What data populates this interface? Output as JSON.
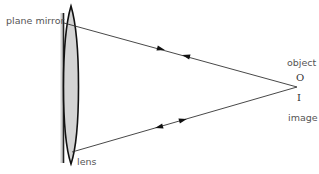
{
  "labels": {
    "mirror": "plane mirror",
    "lens": "lens",
    "object": "object",
    "object_symbol": "O",
    "image_symbol": "I",
    "image": "image"
  },
  "colors": {
    "line": "#222222",
    "lens_fill": "#d4d4d4",
    "mirror_fill": "#cfcfcf",
    "text": "#555555"
  },
  "geometry": {
    "focal_point": [
      297,
      87
    ],
    "top_ray_start": [
      66,
      20
    ],
    "bottom_ray_start": [
      74,
      152
    ],
    "mirror_x": 63,
    "lens_center_x": 72
  }
}
